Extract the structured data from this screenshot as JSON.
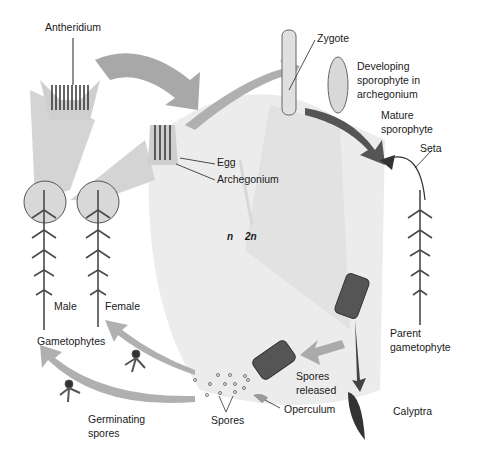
{
  "diagram": {
    "colors": {
      "background": "#ffffff",
      "circle": "#ececec",
      "arrow": "#9a9a9a",
      "dark_arrow": "#555555",
      "plant": "#4a4a4a",
      "text": "#1a1a1a"
    },
    "labels": {
      "antheridium": "Antheridium",
      "egg": "Egg",
      "archegonium": "Archegonium",
      "zygote": "Zygote",
      "developing_1": "Developing",
      "developing_2": "sporophyte in",
      "developing_3": "archegonium",
      "mature_1": "Mature",
      "mature_2": "sporophyte",
      "seta": "Seta",
      "n": "n",
      "two_n": "2n",
      "male": "Male",
      "female": "Female",
      "gametophytes": "Gametophytes",
      "parent_1": "Parent",
      "parent_2": "gametophyte",
      "spores_released_1": "Spores",
      "spores_released_2": "released",
      "operculum": "Operculum",
      "calyptra": "Calyptra",
      "spores": "Spores",
      "germinating_1": "Germinating",
      "germinating_2": "spores"
    }
  }
}
